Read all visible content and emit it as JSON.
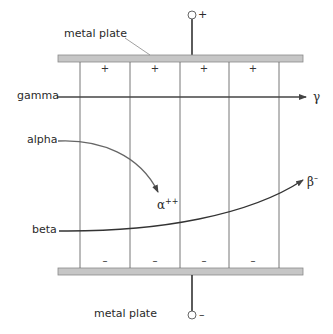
{
  "colors": {
    "plate_fill": "#c6c6c6",
    "plate_border": "#8a8a8a",
    "line": "#555555",
    "arrow": "#444444",
    "text": "#2a2a2a"
  },
  "top_plate": {
    "label": "metal plate",
    "terminal_sign": "+",
    "charge_signs": [
      "+",
      "+",
      "+",
      "+"
    ]
  },
  "bottom_plate": {
    "label": "metal plate",
    "terminal_sign": "–",
    "charge_signs": [
      "–",
      "–",
      "–",
      "–"
    ]
  },
  "rays": [
    {
      "id": "gamma",
      "label": "gamma",
      "result_symbol": "γ",
      "result_sup": ""
    },
    {
      "id": "alpha",
      "label": "alpha",
      "result_symbol": "α",
      "result_sup": "++"
    },
    {
      "id": "beta",
      "label": "beta",
      "result_symbol": "β",
      "result_sup": "–"
    }
  ]
}
